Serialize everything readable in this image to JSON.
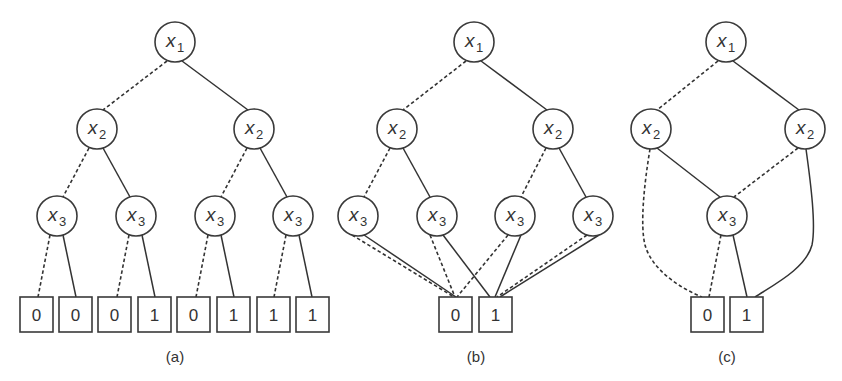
{
  "figure": {
    "panels": [
      {
        "id": "a",
        "caption": "(a)",
        "caption_pos": [
          175,
          362
        ],
        "nodes": [
          {
            "id": "a_x1",
            "var": "x",
            "sub": "1",
            "cx": 175,
            "cy": 42
          },
          {
            "id": "a_x2l",
            "var": "x",
            "sub": "2",
            "cx": 97,
            "cy": 129
          },
          {
            "id": "a_x2r",
            "var": "x",
            "sub": "2",
            "cx": 254,
            "cy": 129
          },
          {
            "id": "a_x3a",
            "var": "x",
            "sub": "3",
            "cx": 57,
            "cy": 216
          },
          {
            "id": "a_x3b",
            "var": "x",
            "sub": "3",
            "cx": 136,
            "cy": 216
          },
          {
            "id": "a_x3c",
            "var": "x",
            "sub": "3",
            "cx": 215,
            "cy": 216
          },
          {
            "id": "a_x3d",
            "var": "x",
            "sub": "3",
            "cx": 293,
            "cy": 216
          }
        ],
        "terminals": [
          {
            "id": "a_t1",
            "value": "0",
            "x": 20,
            "y": 297
          },
          {
            "id": "a_t2",
            "value": "0",
            "x": 59,
            "y": 297
          },
          {
            "id": "a_t3",
            "value": "0",
            "x": 98,
            "y": 297
          },
          {
            "id": "a_t4",
            "value": "1",
            "x": 138,
            "y": 297
          },
          {
            "id": "a_t5",
            "value": "0",
            "x": 177,
            "y": 297
          },
          {
            "id": "a_t6",
            "value": "1",
            "x": 217,
            "y": 297
          },
          {
            "id": "a_t7",
            "value": "1",
            "x": 257,
            "y": 297
          },
          {
            "id": "a_t8",
            "value": "1",
            "x": 296,
            "y": 297
          }
        ],
        "edges": [
          {
            "type": "dashed",
            "d": "M167,61 L103,110"
          },
          {
            "type": "solid",
            "d": "M182,61 L248,110"
          },
          {
            "type": "dashed",
            "d": "M89,148 L63,197"
          },
          {
            "type": "solid",
            "d": "M103,148 L130,197"
          },
          {
            "type": "dashed",
            "d": "M247,148 L221,197"
          },
          {
            "type": "solid",
            "d": "M260,148 L287,197"
          },
          {
            "type": "dashed",
            "d": "M50,235 L38,297"
          },
          {
            "type": "solid",
            "d": "M63,235 L76,297"
          },
          {
            "type": "dashed",
            "d": "M129,235 L117,297"
          },
          {
            "type": "solid",
            "d": "M142,235 L155,297"
          },
          {
            "type": "dashed",
            "d": "M208,235 L196,297"
          },
          {
            "type": "solid",
            "d": "M221,235 L234,297"
          },
          {
            "type": "dashed",
            "d": "M286,235 L274,297"
          },
          {
            "type": "solid",
            "d": "M299,235 L312,297"
          }
        ]
      },
      {
        "id": "b",
        "caption": "(b)",
        "caption_pos": [
          476,
          362
        ],
        "nodes": [
          {
            "id": "b_x1",
            "var": "x",
            "sub": "1",
            "cx": 474,
            "cy": 42
          },
          {
            "id": "b_x2l",
            "var": "x",
            "sub": "2",
            "cx": 397,
            "cy": 129
          },
          {
            "id": "b_x2r",
            "var": "x",
            "sub": "2",
            "cx": 553,
            "cy": 129
          },
          {
            "id": "b_x3a",
            "var": "x",
            "sub": "3",
            "cx": 358,
            "cy": 216
          },
          {
            "id": "b_x3b",
            "var": "x",
            "sub": "3",
            "cx": 437,
            "cy": 216
          },
          {
            "id": "b_x3c",
            "var": "x",
            "sub": "3",
            "cx": 515,
            "cy": 216
          },
          {
            "id": "b_x3d",
            "var": "x",
            "sub": "3",
            "cx": 593,
            "cy": 216
          }
        ],
        "terminals": [
          {
            "id": "b_t0",
            "value": "0",
            "x": 439,
            "y": 297
          },
          {
            "id": "b_t1",
            "value": "1",
            "x": 479,
            "y": 297
          }
        ],
        "edges": [
          {
            "type": "dashed",
            "d": "M466,61 L403,110"
          },
          {
            "type": "solid",
            "d": "M481,61 L547,110"
          },
          {
            "type": "dashed",
            "d": "M390,148 L364,197"
          },
          {
            "type": "solid",
            "d": "M403,148 L430,197"
          },
          {
            "type": "dashed",
            "d": "M546,148 L521,197"
          },
          {
            "type": "solid",
            "d": "M559,148 L586,197"
          },
          {
            "type": "dashed",
            "d": "M352,235 L454,297"
          },
          {
            "type": "solid",
            "d": "M364,235 L456,297"
          },
          {
            "type": "dashed",
            "d": "M430,235 L455,297"
          },
          {
            "type": "solid",
            "d": "M443,235 L490,297"
          },
          {
            "type": "dashed",
            "d": "M508,235 L457,297"
          },
          {
            "type": "solid",
            "d": "M521,235 L495,297"
          },
          {
            "type": "dashed",
            "d": "M587,235 L497,297"
          },
          {
            "type": "solid",
            "d": "M599,235 L500,297"
          }
        ]
      },
      {
        "id": "c",
        "caption": "(c)",
        "caption_pos": [
          727,
          362
        ],
        "nodes": [
          {
            "id": "c_x1",
            "var": "x",
            "sub": "1",
            "cx": 726,
            "cy": 42
          },
          {
            "id": "c_x2l",
            "var": "x",
            "sub": "2",
            "cx": 651,
            "cy": 129
          },
          {
            "id": "c_x2r",
            "var": "x",
            "sub": "2",
            "cx": 805,
            "cy": 129
          },
          {
            "id": "c_x3",
            "var": "x",
            "sub": "3",
            "cx": 727,
            "cy": 216
          }
        ],
        "terminals": [
          {
            "id": "c_t0",
            "value": "0",
            "x": 691,
            "y": 297
          },
          {
            "id": "c_t1",
            "value": "1",
            "x": 730,
            "y": 297
          }
        ],
        "edges": [
          {
            "type": "dashed",
            "d": "M718,61 L657,110"
          },
          {
            "type": "solid",
            "d": "M733,61 L799,110"
          },
          {
            "type": "solid",
            "d": "M657,148 L720,197"
          },
          {
            "type": "dashed",
            "d": "M798,148 L734,197"
          },
          {
            "type": "dashed",
            "d": "M650,149 C644,185 640,225 645,245 C652,270 680,288 702,297"
          },
          {
            "type": "solid",
            "d": "M806,149 C811,185 816,225 812,245 C806,268 775,284 755,297"
          },
          {
            "type": "dashed",
            "d": "M721,235 L709,297"
          },
          {
            "type": "solid",
            "d": "M733,235 L747,297"
          }
        ]
      }
    ],
    "style": {
      "node_radius": 20,
      "terminal_width": 33,
      "terminal_height": 35,
      "stroke_color": "#3a3a3a",
      "background": "#ffffff"
    }
  }
}
